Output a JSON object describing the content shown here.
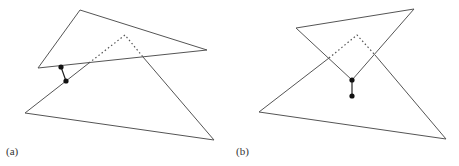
{
  "figure": {
    "stroke_color": "#555555",
    "dot_color": "#111111",
    "panels": [
      {
        "label": "(a)",
        "upper_triangle": [
          [
            80,
            10
          ],
          [
            207,
            50
          ],
          [
            38,
            68
          ]
        ],
        "lower_solid_paths": [
          [
            [
              66,
              81
            ],
            [
              25,
              113
            ],
            [
              214,
              140
            ],
            [
              143,
              57
            ]
          ],
          [
            [
              66,
              81
            ],
            [
              89,
              63
            ]
          ]
        ],
        "dotted_path": [
          [
            89,
            63
          ],
          [
            125,
            35
          ],
          [
            143,
            57
          ]
        ],
        "connector": [
          [
            61,
            67
          ],
          [
            66,
            81
          ]
        ],
        "dots": [
          [
            61,
            67
          ],
          [
            66,
            81
          ]
        ]
      },
      {
        "label": "(b)",
        "upper_triangle": [
          [
            296,
            28
          ],
          [
            414,
            9
          ],
          [
            352,
            80
          ]
        ],
        "lower_solid_paths": [
          [
            [
              329,
              58
            ],
            [
              259,
              112
            ],
            [
              446,
              139
            ],
            [
              375,
              55
            ]
          ]
        ],
        "dotted_path": [
          [
            329,
            58
          ],
          [
            357,
            35
          ],
          [
            375,
            55
          ]
        ],
        "connector": [
          [
            352,
            80
          ],
          [
            352,
            96
          ]
        ],
        "dots": [
          [
            352,
            80
          ],
          [
            352,
            96
          ]
        ]
      }
    ]
  }
}
